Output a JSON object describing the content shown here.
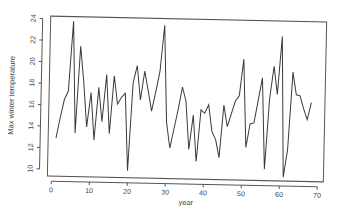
{
  "chart_data": {
    "type": "line",
    "title": "",
    "xlabel": "year",
    "ylabel": "Max winter temperature",
    "xlim": [
      0,
      70
    ],
    "ylim": [
      10,
      24
    ],
    "x_ticks": [
      0,
      10,
      20,
      30,
      40,
      50,
      60,
      70
    ],
    "y_ticks": [
      10,
      12,
      14,
      16,
      18,
      20,
      22,
      24
    ],
    "grid": false,
    "legend": null,
    "series": [
      {
        "name": "Max winter temperature",
        "x": [
          1,
          2,
          3,
          4,
          5,
          6,
          7,
          8,
          9,
          10,
          11,
          12,
          13,
          14,
          15,
          16,
          17,
          18,
          19,
          20,
          21,
          22,
          23,
          24,
          25,
          26,
          27,
          28,
          29,
          30,
          31,
          32,
          33,
          34,
          35,
          36,
          37,
          38,
          39,
          40,
          41,
          42,
          43,
          44,
          45,
          46,
          47,
          48,
          49,
          50,
          51,
          52,
          53,
          54,
          55,
          56,
          57,
          58,
          59,
          60,
          61,
          62,
          63,
          64,
          65,
          66,
          67,
          68
        ],
        "values": [
          12.9,
          14.8,
          16.5,
          17.3,
          23.8,
          13.4,
          21.5,
          18.2,
          14.0,
          17.2,
          12.8,
          17.7,
          14.5,
          18.9,
          13.4,
          18.8,
          16.2,
          16.8,
          17.2,
          10.0,
          18.2,
          19.8,
          16.6,
          19.3,
          17.5,
          15.6,
          17.4,
          19.3,
          23.6,
          14.6,
          12.2,
          14.0,
          15.8,
          17.9,
          16.6,
          12.1,
          15.3,
          11.0,
          15.8,
          15.5,
          16.3,
          13.8,
          13.1,
          11.4,
          16.3,
          14.3,
          15.5,
          16.7,
          17.2,
          20.6,
          12.4,
          14.6,
          14.7,
          16.8,
          18.9,
          10.4,
          17.0,
          20.0,
          17.4,
          22.8,
          9.7,
          12.3,
          19.5,
          17.4,
          17.3,
          16.1,
          15.1,
          16.7
        ]
      }
    ]
  }
}
